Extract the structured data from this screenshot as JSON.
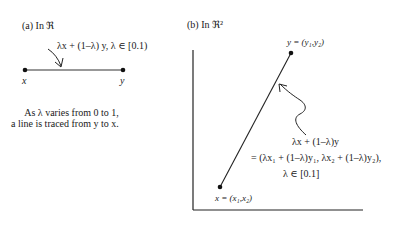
{
  "panel_a": {
    "title": "(a) In ℜ",
    "formula": "λx + (1–λ) y,   λ ∈ [0.1)",
    "point_x_label": "x",
    "point_y_label": "y",
    "caption_line1": "As λ  varies from 0 to 1,",
    "caption_line2": "a line is traced from y to x."
  },
  "panel_b": {
    "title": "(b)  In ℜ²",
    "point_y_label": "y = (y₁,y₂)",
    "point_x_label": "x = (x₁,x₂)",
    "formula_line1": "λx + (1–λ)y",
    "formula_line2": "= (λx₁ + (1–λ)y₁,  λx₂ + (1–λ)y₂),",
    "formula_line3": "λ ∈ [0.1]"
  },
  "colors": {
    "ink": "#1a1a1a",
    "background": "#ffffff"
  }
}
